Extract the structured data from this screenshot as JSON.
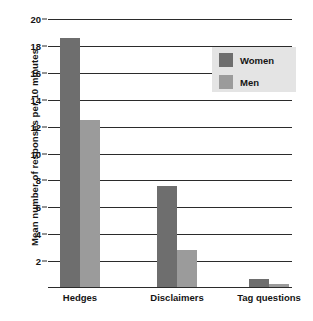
{
  "chart_data": {
    "type": "bar",
    "title": "",
    "xlabel": "",
    "ylabel": "Mean number of responses per 10 minutes",
    "ylim": [
      0,
      20
    ],
    "ytick_step": 2,
    "yticks": [
      20,
      18,
      16,
      14,
      12,
      10,
      8,
      6,
      4,
      2
    ],
    "grid": true,
    "legend_position": "top-right",
    "categories": [
      "Hedges",
      "Disclaimers",
      "Tag questions"
    ],
    "series": [
      {
        "name": "Women",
        "color": "#6e6e6e",
        "values": [
          18.6,
          7.6,
          0.7
        ]
      },
      {
        "name": "Men",
        "color": "#9b9b9b",
        "values": [
          12.5,
          2.8,
          0.3
        ]
      }
    ]
  },
  "legend": {
    "items": [
      {
        "label": "Women",
        "color": "#6e6e6e"
      },
      {
        "label": "Men",
        "color": "#9b9b9b"
      }
    ]
  },
  "axis": {
    "y_title": "Mean number of responses per 10 minutes",
    "tick_labels": [
      "20",
      "18",
      "16",
      "14",
      "12",
      "10",
      "8",
      "6",
      "4",
      "2"
    ]
  },
  "colors": {
    "women": "#6e6e6e",
    "men": "#9b9b9b",
    "axis": "#2b2b2b",
    "legend_background": "#e4e4e4",
    "plot_background": "#ffffff"
  }
}
